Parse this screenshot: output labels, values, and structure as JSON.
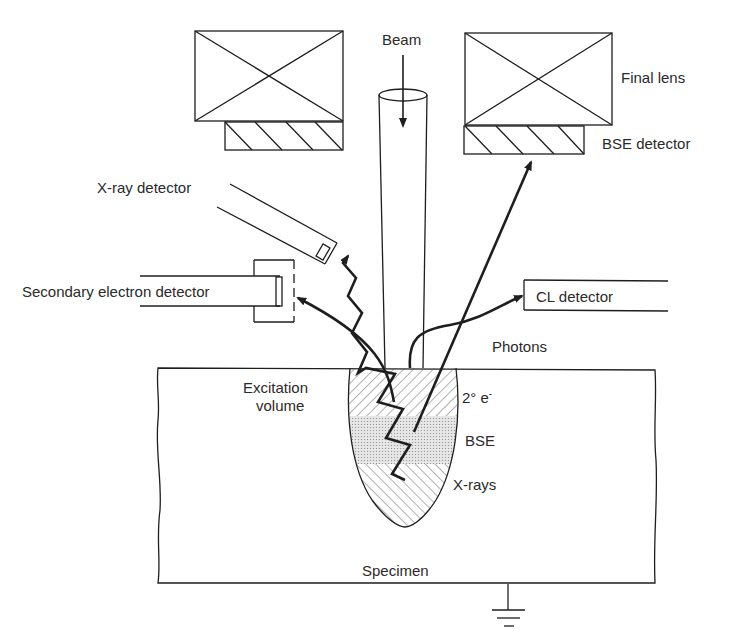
{
  "diagram": {
    "labels": {
      "beam": "Beam",
      "final_lens": "Final lens",
      "bse_detector": "BSE detector",
      "xray_detector": "X-ray detector",
      "se_detector": "Secondary electron detector",
      "cl_detector": "CL detector",
      "photons": "Photons",
      "excitation_volume_line1": "Excitation",
      "excitation_volume_line2": "volume",
      "secondary_electrons": "2° e",
      "secondary_electrons_sup": "-",
      "bse": "BSE",
      "xrays": "X-rays",
      "specimen": "Specimen"
    },
    "components": [
      {
        "name": "final-lens-left",
        "type": "lens-block",
        "hatched_detector_below": true
      },
      {
        "name": "final-lens-right",
        "type": "lens-block",
        "hatched_detector_below": true
      },
      {
        "name": "electron-beam",
        "type": "cone",
        "arrow": "down"
      },
      {
        "name": "xray-detector",
        "type": "angled-tube",
        "signal": "X-rays",
        "path": "zigzag"
      },
      {
        "name": "se-detector",
        "type": "tube-with-cage",
        "signal": "secondary electrons"
      },
      {
        "name": "cl-detector",
        "type": "tube",
        "signal": "photons"
      },
      {
        "name": "bse-detector",
        "type": "annular",
        "signal": "backscattered electrons"
      },
      {
        "name": "specimen",
        "type": "block",
        "grounded": true
      },
      {
        "name": "excitation-volume",
        "type": "teardrop",
        "zones": [
          "2° e-",
          "BSE",
          "X-rays"
        ]
      }
    ],
    "colors": {
      "ink": "#1e1e1e",
      "text": "#2a2a2a",
      "background": "#ffffff",
      "bse_zone_fill": "#d9d9d9"
    }
  }
}
